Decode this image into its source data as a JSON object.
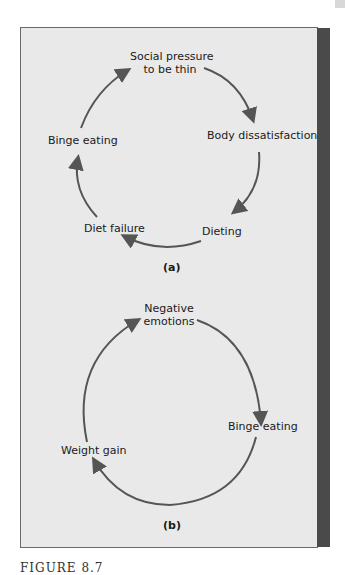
{
  "panel_a": {
    "nodes": [
      "Social pressure",
      "to be thin",
      "Body dissatisfaction",
      "Dieting",
      "Diet failure",
      "Binge eating"
    ],
    "caption": "(a)"
  },
  "panel_b": {
    "nodes": [
      "Negative",
      "emotions",
      "Binge eating",
      "Weight gain"
    ],
    "caption": "(b)"
  },
  "figure_label": "FIGURE 8.7",
  "colors": {
    "arrow": "#555555",
    "panel": "#e9e9e9",
    "edge": "#4a4a4a"
  }
}
